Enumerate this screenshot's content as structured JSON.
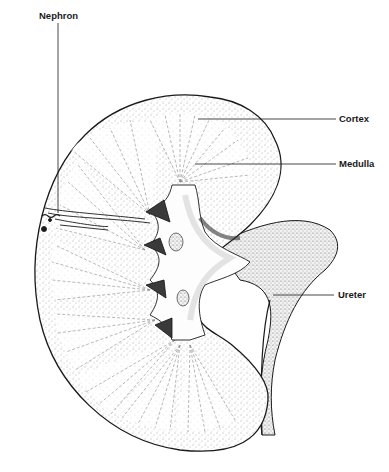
{
  "diagram": {
    "labels": {
      "nephron": "Nephron",
      "cortex": "Cortex",
      "medulla": "Medulla",
      "ureter": "Ureter"
    },
    "colors": {
      "ink": "#1a1a1a",
      "stipple": "#555555",
      "background": "#ffffff"
    }
  }
}
